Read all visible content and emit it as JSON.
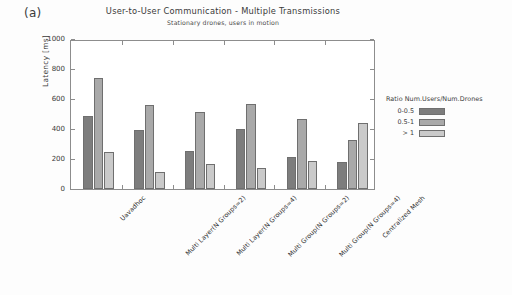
{
  "panel": {
    "label": "(a)"
  },
  "legend": {
    "title": "Ratio Num.Users/Num.Drones",
    "entries": [
      {
        "key": "0-0.5",
        "color": "#7d7d7d"
      },
      {
        "key": "0.5-1",
        "color": "#a9a9a9"
      },
      {
        "key": "> 1",
        "color": "#cacaca"
      }
    ],
    "position": "right"
  },
  "chart_data": {
    "type": "bar",
    "title": "User-to-User Communication - Multiple Transmissions",
    "subtitle": "Stationary drones, users in motion",
    "xlabel": "",
    "ylabel": "Latency [ms]",
    "ylim": [
      0,
      1000
    ],
    "yticks": [
      0,
      200,
      400,
      600,
      800,
      1000
    ],
    "grid": false,
    "categories": [
      "Uavadhoc",
      "Multi Layer(N Groups=2)",
      "Multi Layer(N Groups=4)",
      "Multi Group(N Groups=2)",
      "Multi Group(N Groups=4)",
      "Centralized Mesh"
    ],
    "series": [
      {
        "name": "0-0.5",
        "color": "#7d7d7d",
        "values": [
          485,
          395,
          255,
          400,
          215,
          180
        ]
      },
      {
        "name": "0.5-1",
        "color": "#a9a9a9",
        "values": [
          740,
          560,
          515,
          565,
          470,
          330
        ]
      },
      {
        "name": "> 1",
        "color": "#cacaca",
        "values": [
          245,
          115,
          170,
          140,
          190,
          440
        ]
      }
    ]
  }
}
